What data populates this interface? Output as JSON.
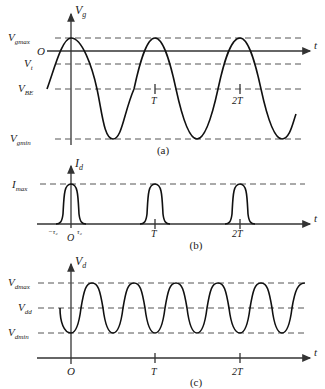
{
  "figure": {
    "panels": [
      {
        "id": "a",
        "caption": "(a)",
        "y_axis_label": "V",
        "y_axis_sub": "g",
        "x_axis_label": "t",
        "origin_label": "O",
        "levels": [
          {
            "name": "Vgmax",
            "main": "V",
            "sub": "gmax"
          },
          {
            "name": "Vt",
            "main": "V",
            "sub": "t"
          },
          {
            "name": "VBE",
            "main": "V",
            "sub": "BE"
          },
          {
            "name": "Vgmin",
            "main": "V",
            "sub": "gmin"
          }
        ],
        "ticks": [
          "T",
          "2T"
        ]
      },
      {
        "id": "b",
        "caption": "(b)",
        "y_axis_label": "I",
        "y_axis_sub": "d",
        "x_axis_label": "t",
        "origin_label": "O",
        "levels": [
          {
            "name": "Imax",
            "main": "I",
            "sub": "max"
          }
        ],
        "ticks": [
          "T",
          "2T"
        ],
        "pulse_labels": [
          "−τ₂",
          "τ₂"
        ]
      },
      {
        "id": "c",
        "caption": "(c)",
        "y_axis_label": "V",
        "y_axis_sub": "d",
        "x_axis_label": "t",
        "origin_label": "O",
        "levels": [
          {
            "name": "Vdmax",
            "main": "V",
            "sub": "dmax"
          },
          {
            "name": "Vdd",
            "main": "V",
            "sub": "dd"
          },
          {
            "name": "Vdmin",
            "main": "V",
            "sub": "dmin"
          }
        ],
        "ticks": [
          "T",
          "2T"
        ]
      }
    ]
  }
}
